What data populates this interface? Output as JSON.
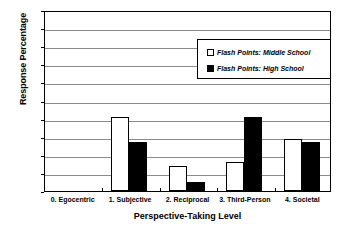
{
  "chart_data": {
    "type": "bar",
    "title": "",
    "xlabel": "Perspective-Taking Level",
    "ylabel": "Response Percentage",
    "ylim": [
      0,
      100
    ],
    "yticks": [
      100,
      90,
      80,
      70,
      60,
      50,
      40,
      30,
      20,
      10,
      0
    ],
    "grid": true,
    "legend_position": "upper-right",
    "categories": [
      "0. Egocentric",
      "1. Subjective",
      "2. Reciprocal",
      "3. Third-Person",
      "4. Societal"
    ],
    "series": [
      {
        "name": "Flash Points: Middle School",
        "style": "open-white-bar",
        "color": "#ffffff",
        "values": [
          0,
          41,
          14,
          16,
          29
        ]
      },
      {
        "name": "Flash Points: High School",
        "style": "solid-black-bar",
        "color": "#000000",
        "values": [
          0,
          27,
          5,
          41,
          27
        ]
      }
    ]
  },
  "legend": {
    "items": [
      {
        "label": "Flash Points: Middle School",
        "swatch": "open"
      },
      {
        "label": "Flash Points: High School",
        "swatch": "filled"
      }
    ]
  },
  "colors": {
    "series_middle_school": "#ffffff",
    "series_high_school": "#000000",
    "axis": "#000000",
    "gridline": "#8a8a8a",
    "background": "#ffffff"
  }
}
